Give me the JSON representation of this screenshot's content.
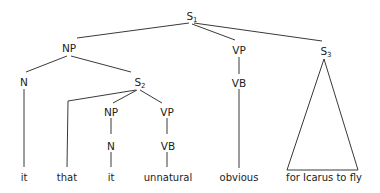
{
  "diagram": {
    "type": "syntax-tree",
    "nodes": {
      "s1": {
        "label": "S",
        "sub": "1"
      },
      "np1": {
        "label": "NP"
      },
      "n1": {
        "label": "N"
      },
      "s2": {
        "label": "S",
        "sub": "2"
      },
      "np2": {
        "label": "NP"
      },
      "n2": {
        "label": "N"
      },
      "vp2": {
        "label": "VP"
      },
      "vb2": {
        "label": "VB"
      },
      "vp1": {
        "label": "VP"
      },
      "vb1": {
        "label": "VB"
      },
      "s3": {
        "label": "S",
        "sub": "3"
      }
    },
    "leaves": {
      "it1": "it",
      "that": "that",
      "it2": "it",
      "unnatural": "unnatural",
      "obvious": "obvious",
      "s3_phrase": "for Icarus to fly"
    },
    "structure": "[S1 [NP [N it] [S2 that [NP [N it]] [VP [VB unnatural]]]] [VP [VB obvious]] [S3 for Icarus to fly]]"
  }
}
